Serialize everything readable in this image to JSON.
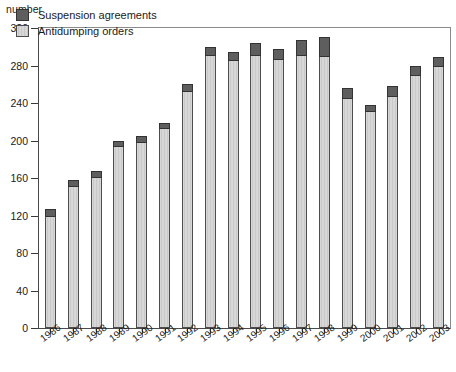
{
  "chart_data": {
    "type": "bar",
    "stacked": true,
    "title": "",
    "unit_label": "number",
    "xlabel": "",
    "ylabel": "number",
    "ylim": [
      0,
      320
    ],
    "ytick_step": 40,
    "yticks": [
      0,
      40,
      80,
      120,
      160,
      200,
      240,
      280,
      320
    ],
    "ytick_labels": [
      "0",
      "40",
      "80",
      "120",
      "160",
      "200",
      "240",
      "280",
      "320"
    ],
    "grid": false,
    "legend_position": "top-left",
    "categories": [
      "1986",
      "1987",
      "1988",
      "1989",
      "1990",
      "1991",
      "1992",
      "1993",
      "1994",
      "1995",
      "1996",
      "1997",
      "1998",
      "1999",
      "2000",
      "2001",
      "2002",
      "2003"
    ],
    "series": [
      {
        "name": "Antidumping orders",
        "color": "#c9c9c9",
        "values": [
          120,
          152,
          161,
          194,
          198,
          213,
          253,
          291,
          286,
          291,
          287,
          291,
          290,
          245,
          231,
          247,
          270,
          280
        ]
      },
      {
        "name": "Suspension agreements",
        "color": "#5e5e5e",
        "values": [
          7,
          6,
          7,
          6,
          7,
          6,
          7,
          9,
          8,
          13,
          11,
          16,
          20,
          11,
          7,
          11,
          9,
          9
        ]
      }
    ],
    "totals": [
      127,
      158,
      168,
      200,
      205,
      219,
      260,
      300,
      294,
      304,
      298,
      307,
      310,
      256,
      238,
      258,
      279,
      289
    ]
  },
  "legend": {
    "items": [
      {
        "label": "Suspension agreements",
        "swatch": "dark-swatch"
      },
      {
        "label": "Antidumping orders",
        "swatch": "light-swatch"
      }
    ]
  }
}
